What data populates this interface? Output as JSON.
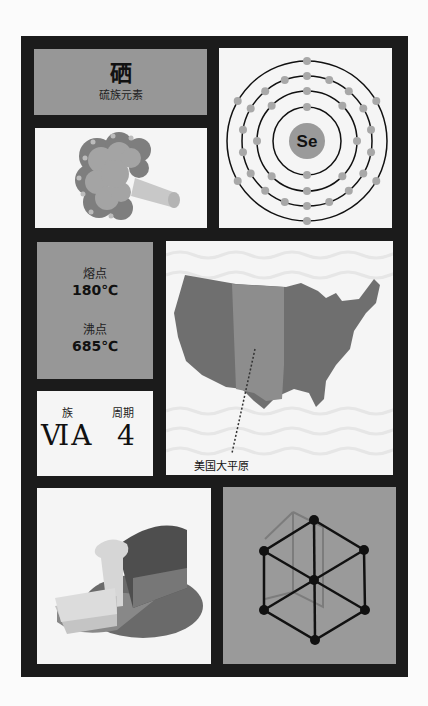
{
  "element": {
    "name": "硒",
    "family": "硫族元素",
    "symbol": "Se"
  },
  "atom_model": {
    "symbol": "Se",
    "shells": [
      2,
      8,
      18,
      6
    ],
    "colors": {
      "electron": "#a8a8a8",
      "nucleus": "#9a9a9a",
      "orbit": "#111111"
    }
  },
  "properties": {
    "melting_label": "熔点",
    "melting_value": "180℃",
    "boiling_label": "沸点",
    "boiling_value": "685℃"
  },
  "periodic": {
    "group_label": "族",
    "period_label": "周期",
    "group_value": "ⅥA",
    "period_value": "4"
  },
  "map": {
    "caption": "美国大平原"
  },
  "images": {
    "food1": "broccoli",
    "food2": "bread",
    "structure": "hexagonal-crystal-lattice"
  },
  "colors": {
    "frame": "#1b1b1b",
    "panel_gray": "#979797",
    "panel_white": "#f5f5f5",
    "background": "#fbfbfb"
  }
}
